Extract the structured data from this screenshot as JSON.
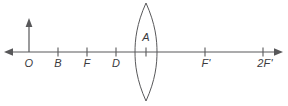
{
  "figure": {
    "kind": "optics-ray-diagram",
    "background_color": "#ffffff",
    "line_color": "#58585a",
    "label_color": "#3b3b3d",
    "axis": {
      "name": "principal-axis",
      "y": 52,
      "x_start": 5,
      "x_end": 282,
      "left_arrow": true,
      "right_arrow": true
    },
    "object_arrow": {
      "name": "object-arrow",
      "x": 29,
      "y_base": 52,
      "y_tip": 19,
      "direction": "up"
    },
    "lens": {
      "name": "converging-lens",
      "center_x": 146,
      "half_width": 11,
      "top_y": 3,
      "bottom_y": 101,
      "type": "biconvex"
    },
    "points": [
      {
        "id": "O",
        "label": "O",
        "x": 29,
        "tick": true
      },
      {
        "id": "B",
        "label": "B",
        "x": 58,
        "tick": true
      },
      {
        "id": "F",
        "label": "F",
        "x": 87,
        "tick": true
      },
      {
        "id": "D",
        "label": "D",
        "x": 116,
        "tick": true
      },
      {
        "id": "A",
        "label": "A",
        "x": 146,
        "tick": true
      },
      {
        "id": "Fp",
        "label": "F'",
        "x": 205,
        "tick": true
      },
      {
        "id": "2Fp",
        "label": "2F'",
        "x": 263,
        "tick": true
      }
    ],
    "axis_labels": [
      {
        "ref": "O",
        "text": "O",
        "x": 29,
        "y": 58
      },
      {
        "ref": "B",
        "text": "B",
        "x": 58,
        "y": 58
      },
      {
        "ref": "F",
        "text": "F",
        "x": 87,
        "y": 58
      },
      {
        "ref": "D",
        "text": "D",
        "x": 116,
        "y": 58
      },
      {
        "ref": "Fp",
        "text": "F'",
        "x": 206,
        "y": 58
      },
      {
        "ref": "2Fp",
        "text": "2F'",
        "x": 265,
        "y": 58
      }
    ],
    "apex_label": {
      "ref": "A",
      "text": "A",
      "x": 146,
      "y": 32
    }
  }
}
